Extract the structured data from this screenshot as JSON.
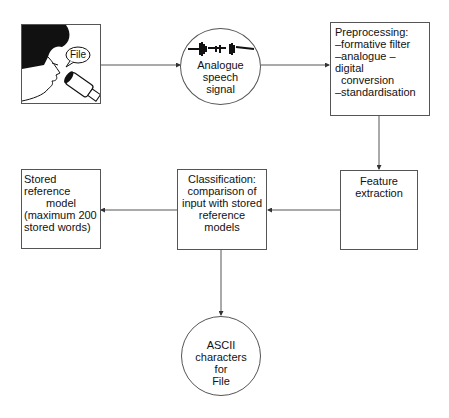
{
  "diagram": {
    "speaker": {
      "speech_bubble": "File",
      "icon": "person-speaking-into-microphone-icon"
    },
    "analogue_signal": {
      "icon": "waveform-icon",
      "label_lines": [
        "Analogue",
        "speech",
        "signal"
      ]
    },
    "preprocessing": {
      "title": "Preprocessing:",
      "items": [
        "–formative filter",
        "–analogue – digital",
        "conversion",
        "–standardisation"
      ]
    },
    "feature_extraction": {
      "label_lines": [
        "Feature",
        "extraction"
      ]
    },
    "classification": {
      "label_lines": [
        "Classification:",
        "comparison of",
        "input with stored",
        "reference models"
      ]
    },
    "stored_reference": {
      "label_lines": [
        "Stored reference",
        "model",
        "(maximum 200",
        "stored words)"
      ]
    },
    "output": {
      "label_lines": [
        "ASCII characters",
        "for",
        "File"
      ]
    },
    "colors": {
      "line": "#555555",
      "text": "#111111",
      "background": "#ffffff"
    }
  }
}
